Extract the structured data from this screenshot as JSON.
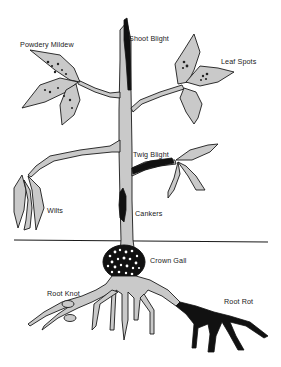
{
  "diagram": {
    "labels": {
      "powdery_mildew": "Powdery Mildew",
      "shoot_blight": "Shoot Blight",
      "leaf_spots": "Leaf Spots",
      "twig_blight": "Twig Blight",
      "wilts": "Wilts",
      "cankers": "Cankers",
      "crown_gall": "Crown Gall",
      "root_knot": "Root Knot",
      "root_rot": "Root Rot"
    },
    "colors": {
      "background": "#ffffff",
      "plant_fill": "#c9c9c9",
      "outline": "#1a1a1a",
      "disease_dark": "#111111"
    }
  }
}
